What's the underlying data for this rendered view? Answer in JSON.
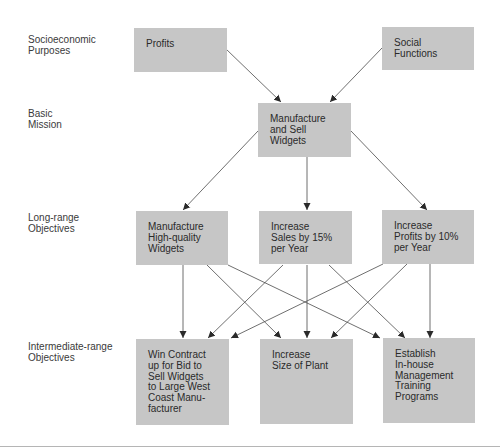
{
  "diagram": {
    "levels": [
      {
        "id": "socioeconomic",
        "label": "Socioeconomic\nPurposes"
      },
      {
        "id": "mission",
        "label": "Basic\nMission"
      },
      {
        "id": "long_range",
        "label": "Long-range\nObjectives"
      },
      {
        "id": "intermediate",
        "label": "Intermediate-range\nObjectives"
      }
    ],
    "nodes": {
      "profits": "Profits",
      "social_functions": "Social\nFunctions",
      "mission": "Manufacture\nand Sell\nWidgets",
      "lr_quality": "Manufacture\nHigh-quality\nWidgets",
      "lr_sales": "Increase\nSales by 15%\nper Year",
      "lr_profits": "Increase\nProfits by 10%\nper Year",
      "ir_contract": "Win Contract\nup for Bid to\nSell Widgets\nto Large West\nCoast Manu-\nfacturer",
      "ir_plant": "Increase\nSize of Plant",
      "ir_training": "Establish\nIn-house\nManagement\nTraining\nPrograms"
    },
    "edges": [
      {
        "from": "profits",
        "to": "mission"
      },
      {
        "from": "social_functions",
        "to": "mission"
      },
      {
        "from": "mission",
        "to": "lr_quality"
      },
      {
        "from": "mission",
        "to": "lr_sales"
      },
      {
        "from": "mission",
        "to": "lr_profits"
      },
      {
        "from": "lr_quality",
        "to": "ir_contract"
      },
      {
        "from": "lr_quality",
        "to": "ir_plant"
      },
      {
        "from": "lr_quality",
        "to": "ir_training"
      },
      {
        "from": "lr_sales",
        "to": "ir_contract"
      },
      {
        "from": "lr_sales",
        "to": "ir_plant"
      },
      {
        "from": "lr_sales",
        "to": "ir_training"
      },
      {
        "from": "lr_profits",
        "to": "ir_contract"
      },
      {
        "from": "lr_profits",
        "to": "ir_plant"
      },
      {
        "from": "lr_profits",
        "to": "ir_training"
      }
    ],
    "colors": {
      "box_fill": "#c6c6c6",
      "line": "#3a3a3a",
      "text": "#2a2a2a"
    }
  }
}
